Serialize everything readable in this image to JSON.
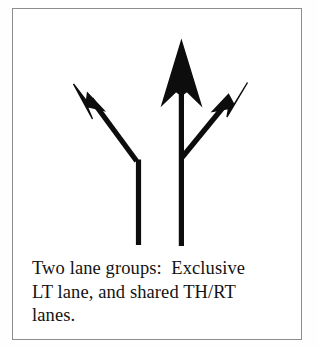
{
  "figure": {
    "background_color": "#fefefe",
    "frame_color": "#8c8c8c",
    "ink_color": "#0d0d0d",
    "caption": {
      "full_text": "Two lane groups:  Exclusive LT lane, and shared TH/RT lanes.",
      "lines": [
        "Two lane groups:  Exclusive",
        "LT lane, and shared TH/RT",
        "lanes."
      ]
    },
    "diagram": {
      "description": "Lane movement arrow diagram showing two lane groups",
      "arrows": [
        {
          "name": "left-turn-arrow",
          "movement": "LT",
          "label": "exclusive left turn lane",
          "lane_group": 1,
          "tip": [
            73,
            85
          ],
          "bend": [
            135,
            158
          ],
          "tail": [
            137,
            245
          ],
          "head_style": "barbed"
        },
        {
          "name": "through-arrow",
          "movement": "TH",
          "label": "through movement",
          "lane_group": 2,
          "tip": [
            177,
            42
          ],
          "tail": [
            180,
            245
          ],
          "head_style": "barbed"
        },
        {
          "name": "right-turn-arrow",
          "movement": "RT",
          "label": "shared right turn movement",
          "lane_group": 2,
          "tip": [
            238,
            85
          ],
          "junction": [
            180,
            155
          ],
          "head_style": "barbed"
        }
      ],
      "lane_group_count": 2
    }
  }
}
